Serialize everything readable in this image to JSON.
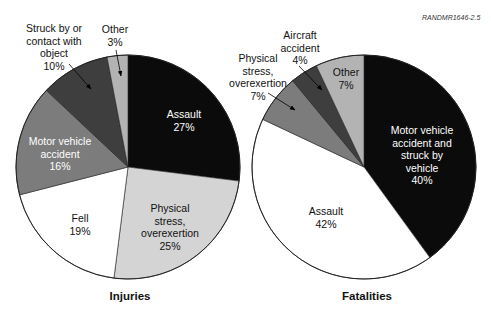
{
  "source_id": "RANDMR1646-2.5",
  "chart_data": [
    {
      "type": "pie",
      "title": "Injuries",
      "start": "12 o'clock, clockwise",
      "slices": [
        {
          "label": "Assault",
          "value": 27,
          "color": "#0b0b0b"
        },
        {
          "label": "Physical stress, overexertion",
          "value": 25,
          "color": "#d4d4d4"
        },
        {
          "label": "Fell",
          "value": 19,
          "color": "#ffffff"
        },
        {
          "label": "Motor vehicle accident",
          "value": 16,
          "color": "#7c7c7c"
        },
        {
          "label": "Struck by or contact with object",
          "value": 10,
          "color": "#3e3e3e"
        },
        {
          "label": "Other",
          "value": 3,
          "color": "#b3b3b3"
        }
      ]
    },
    {
      "type": "pie",
      "title": "Fatalities",
      "start": "12 o'clock, clockwise",
      "slices": [
        {
          "label": "Motor vehicle accident and struck by vehicle",
          "value": 40,
          "color": "#0b0b0b"
        },
        {
          "label": "Assault",
          "value": 42,
          "color": "#ffffff"
        },
        {
          "label": "Physical stress, overexertion",
          "value": 7,
          "color": "#7c7c7c"
        },
        {
          "label": "Aircraft accident",
          "value": 4,
          "color": "#3e3e3e"
        },
        {
          "label": "Other",
          "value": 7,
          "color": "#b3b3b3"
        }
      ]
    }
  ],
  "labels": {
    "injuries": {
      "assault": "Assault\n27%",
      "physical": "Physical\nstress,\noverexertion\n25%",
      "fell": "Fell\n19%",
      "motor": "Motor vehicle\naccident\n16%",
      "struck": "Struck by or\ncontact with\nobject\n10%",
      "other": "Other\n3%"
    },
    "fatalities": {
      "motor": "Motor vehicle\naccident and\nstruck by\nvehicle\n40%",
      "assault": "Assault\n42%",
      "physical": "Physical\nstress,\noverexertion\n7%",
      "aircraft": "Aircraft\naccident\n4%",
      "other": "Other\n7%"
    }
  },
  "titles": {
    "injuries": "Injuries",
    "fatalities": "Fatalities"
  }
}
